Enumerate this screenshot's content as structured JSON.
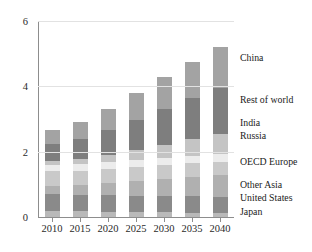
{
  "chart_data": {
    "type": "bar",
    "stacked": true,
    "title": "",
    "xlabel": "",
    "ylabel": "",
    "categories": [
      "2010",
      "2015",
      "2020",
      "2025",
      "2030",
      "2035",
      "2040"
    ],
    "ylim": [
      0,
      6
    ],
    "yticks": [
      0,
      2,
      4,
      6
    ],
    "ytick_labels": [
      "0",
      "2",
      "4",
      "6"
    ],
    "grid": true,
    "grid_axis": "y",
    "legend_position": "right-inline",
    "series": [
      {
        "name": "Japan",
        "color": "#b9b9b9",
        "values": [
          0.18,
          0.17,
          0.16,
          0.15,
          0.14,
          0.13,
          0.12
        ]
      },
      {
        "name": "United States",
        "color": "#8a8a8a",
        "values": [
          0.52,
          0.5,
          0.5,
          0.5,
          0.5,
          0.5,
          0.5
        ]
      },
      {
        "name": "Other Asia",
        "color": "#b0b0b0",
        "values": [
          0.26,
          0.31,
          0.38,
          0.45,
          0.52,
          0.59,
          0.66
        ]
      },
      {
        "name": "OECD Europe",
        "color": "#c9c9c9",
        "values": [
          0.44,
          0.44,
          0.44,
          0.44,
          0.44,
          0.43,
          0.42
        ]
      },
      {
        "name": "Russia",
        "color": "#ececec",
        "values": [
          0.19,
          0.19,
          0.2,
          0.21,
          0.22,
          0.23,
          0.23
        ]
      },
      {
        "name": "India",
        "color": "#c4c4c4",
        "values": [
          0.13,
          0.17,
          0.23,
          0.31,
          0.4,
          0.5,
          0.6
        ]
      },
      {
        "name": "Rest of world",
        "color": "#7e7e7e",
        "values": [
          0.52,
          0.61,
          0.75,
          0.92,
          1.08,
          1.25,
          1.42
        ]
      },
      {
        "name": "China",
        "color": "#a3a3a3",
        "values": [
          0.42,
          0.51,
          0.64,
          0.82,
          0.98,
          1.12,
          1.25
        ]
      }
    ],
    "totals": [
      2.66,
      2.9,
      3.3,
      3.8,
      4.28,
      4.75,
      5.2
    ]
  },
  "legend": {
    "entries": [
      {
        "label": "China",
        "y": 58
      },
      {
        "label": "Rest of world",
        "y": 100
      },
      {
        "label": "India",
        "y": 123
      },
      {
        "label": "Russia",
        "y": 136
      },
      {
        "label": "OECD Europe",
        "y": 162
      },
      {
        "label": "Other Asia",
        "y": 185
      },
      {
        "label": "United States",
        "y": 198
      },
      {
        "label": "Japan",
        "y": 212
      }
    ]
  }
}
